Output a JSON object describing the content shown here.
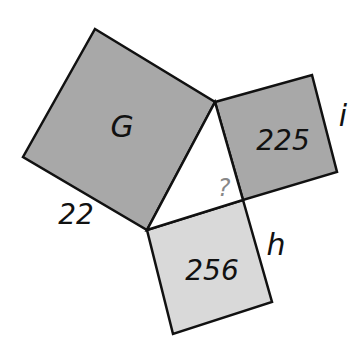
{
  "diagram": {
    "squares": [
      {
        "id": "G",
        "label": "G",
        "color": "#a8a8a8"
      },
      {
        "id": "i",
        "label": "225",
        "color": "#a8a8a8"
      },
      {
        "id": "h",
        "label": "256",
        "color": "#d9d9d9"
      }
    ],
    "side_labels": {
      "g_side": "22",
      "i_side": "i",
      "h_side": "h"
    },
    "unknown_angle": "?",
    "colors": {
      "stroke": "#111111",
      "triangle_fill": "#ffffff",
      "question_mark": "#888888"
    }
  }
}
